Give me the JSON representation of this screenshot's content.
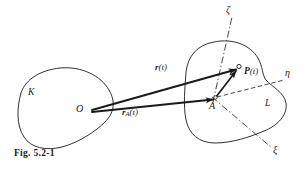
{
  "figure": {
    "caption": "Fig. 5.2-1",
    "background_color": "#ffffff",
    "ink_color": "#1a1a1a",
    "width": 305,
    "height": 171
  },
  "regions": [
    {
      "id": "K",
      "label": "K",
      "label_x": 31,
      "label_y": 93,
      "description": "left closed blob region"
    },
    {
      "id": "L",
      "label": "L",
      "label_x": 267,
      "label_y": 104,
      "description": "right closed blob region"
    }
  ],
  "points": [
    {
      "id": "O",
      "label": "O",
      "x": 89,
      "y": 111,
      "label_x": 79,
      "label_y": 106
    },
    {
      "id": "A",
      "label": "A",
      "x": 216,
      "y": 98,
      "label_x": 210,
      "label_y": 103
    },
    {
      "id": "P",
      "label": "P(t)",
      "x": 239,
      "y": 67,
      "label_x": 243,
      "label_y": 70
    }
  ],
  "vectors": [
    {
      "id": "r",
      "label_bold": "r",
      "label_sub": "",
      "label_rest": "(t)",
      "from": "O",
      "to": "P",
      "x1": 92,
      "y1": 110,
      "x2": 237,
      "y2": 69,
      "label_x": 160,
      "label_y": 68
    },
    {
      "id": "rA",
      "label_bold": "r",
      "label_sub": "A",
      "label_rest": "(t)",
      "from": "O",
      "to": "A",
      "x1": 92,
      "y1": 112,
      "x2": 214,
      "y2": 99,
      "label_x": 127,
      "label_y": 112
    },
    {
      "id": "AP",
      "label_bold": "",
      "label_sub": "",
      "label_rest": "",
      "from": "A",
      "to": "P",
      "x1": 216,
      "y1": 97,
      "x2": 237,
      "y2": 70,
      "label_x": 0,
      "label_y": 0
    }
  ],
  "axes": [
    {
      "id": "zeta",
      "label": "ζ",
      "label_x": 226,
      "label_y": 7,
      "x1": 214,
      "y1": 100,
      "x2": 232,
      "y2": 18,
      "style": "dash-dot"
    },
    {
      "id": "eta",
      "label": "η",
      "label_x": 286,
      "label_y": 73,
      "x1": 216,
      "y1": 98,
      "x2": 283,
      "y2": 80,
      "style": "dashed"
    },
    {
      "id": "xi",
      "label": "ξ",
      "label_x": 274,
      "label_y": 148,
      "x1": 214,
      "y1": 99,
      "x2": 271,
      "y2": 147,
      "style": "dash-dot"
    }
  ],
  "icons": {
    "point_marker": "open-circle-marker",
    "arrow_head": "solid-arrowhead"
  }
}
